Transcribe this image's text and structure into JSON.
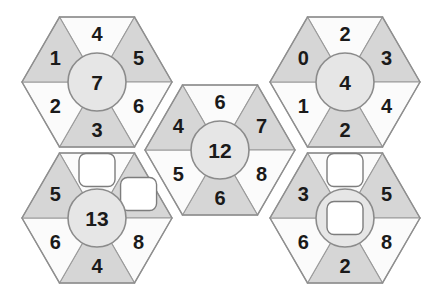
{
  "puzzle": {
    "title": "hexagon-number-wheels",
    "colors": {
      "shaded_segment": "#d6d6d6",
      "plain_segment": "#fbfbfb",
      "hub_fill": "#e6e6e6",
      "outline": "#8f8f8f",
      "blank_box": "#ffffff",
      "number": "#1a1a1a",
      "background": "#ffffff"
    },
    "blank_marker": "",
    "hexagons": [
      {
        "name": "top-left",
        "cx": 97,
        "cy": 82,
        "hub": "7",
        "hub_blank": false,
        "segments": [
          {
            "position": "top",
            "value": "4",
            "shaded": false,
            "blank": false
          },
          {
            "position": "upper-right",
            "value": "5",
            "shaded": true,
            "blank": false
          },
          {
            "position": "lower-right",
            "value": "6",
            "shaded": false,
            "blank": false
          },
          {
            "position": "bottom",
            "value": "3",
            "shaded": true,
            "blank": false
          },
          {
            "position": "lower-left",
            "value": "2",
            "shaded": false,
            "blank": false
          },
          {
            "position": "upper-left",
            "value": "1",
            "shaded": true,
            "blank": false
          }
        ]
      },
      {
        "name": "top-right",
        "cx": 345,
        "cy": 82,
        "hub": "4",
        "hub_blank": false,
        "segments": [
          {
            "position": "top",
            "value": "2",
            "shaded": false,
            "blank": false
          },
          {
            "position": "upper-right",
            "value": "3",
            "shaded": true,
            "blank": false
          },
          {
            "position": "lower-right",
            "value": "4",
            "shaded": false,
            "blank": false
          },
          {
            "position": "bottom",
            "value": "2",
            "shaded": true,
            "blank": false
          },
          {
            "position": "lower-left",
            "value": "1",
            "shaded": false,
            "blank": false
          },
          {
            "position": "upper-left",
            "value": "0",
            "shaded": true,
            "blank": false
          }
        ]
      },
      {
        "name": "center",
        "cx": 220,
        "cy": 150,
        "hub": "12",
        "hub_blank": false,
        "segments": [
          {
            "position": "top",
            "value": "6",
            "shaded": false,
            "blank": false
          },
          {
            "position": "upper-right",
            "value": "7",
            "shaded": true,
            "blank": false
          },
          {
            "position": "lower-right",
            "value": "8",
            "shaded": false,
            "blank": false
          },
          {
            "position": "bottom",
            "value": "6",
            "shaded": true,
            "blank": false
          },
          {
            "position": "lower-left",
            "value": "5",
            "shaded": false,
            "blank": false
          },
          {
            "position": "upper-left",
            "value": "4",
            "shaded": true,
            "blank": false
          }
        ]
      },
      {
        "name": "bottom-left",
        "cx": 97,
        "cy": 218,
        "hub": "13",
        "hub_blank": false,
        "segments": [
          {
            "position": "top",
            "value": "",
            "shaded": false,
            "blank": true
          },
          {
            "position": "upper-right",
            "value": "",
            "shaded": true,
            "blank": true
          },
          {
            "position": "lower-right",
            "value": "8",
            "shaded": false,
            "blank": false
          },
          {
            "position": "bottom",
            "value": "4",
            "shaded": true,
            "blank": false
          },
          {
            "position": "lower-left",
            "value": "6",
            "shaded": false,
            "blank": false
          },
          {
            "position": "upper-left",
            "value": "5",
            "shaded": true,
            "blank": false
          }
        ]
      },
      {
        "name": "bottom-right",
        "cx": 345,
        "cy": 218,
        "hub": "",
        "hub_blank": true,
        "segments": [
          {
            "position": "top",
            "value": "",
            "shaded": false,
            "blank": true
          },
          {
            "position": "upper-right",
            "value": "5",
            "shaded": true,
            "blank": false
          },
          {
            "position": "lower-right",
            "value": "8",
            "shaded": false,
            "blank": false
          },
          {
            "position": "bottom",
            "value": "2",
            "shaded": true,
            "blank": false
          },
          {
            "position": "lower-left",
            "value": "6",
            "shaded": false,
            "blank": false
          },
          {
            "position": "upper-left",
            "value": "3",
            "shaded": true,
            "blank": false
          }
        ]
      }
    ]
  }
}
